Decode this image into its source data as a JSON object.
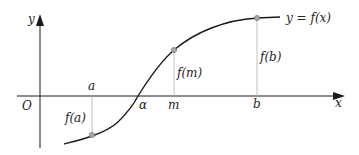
{
  "diagram": {
    "axes": {
      "x_label": "x",
      "y_label": "y",
      "origin_label": "O"
    },
    "curve_label": "y = f(x)",
    "points": [
      {
        "x_label": "a",
        "value_label": "f(a)"
      },
      {
        "x_label": "m",
        "value_label": "f(m)"
      },
      {
        "x_label": "b",
        "value_label": "f(b)"
      }
    ],
    "root_label": "α",
    "colors": {
      "curve": "#1a1a1a",
      "axis": "#1a1a1a",
      "guide": "#b0b0b0",
      "point_fill": "#a8a8a8"
    }
  }
}
